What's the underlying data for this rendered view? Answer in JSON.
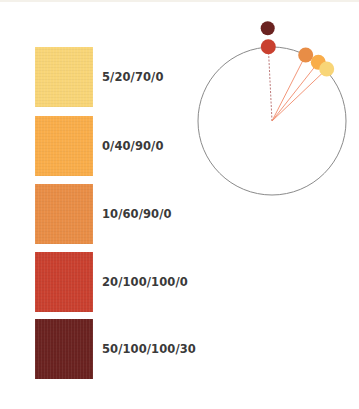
{
  "swatches": [
    {
      "label": "5/20/70/0",
      "color": "#f8d577"
    },
    {
      "label": "0/40/90/0",
      "color": "#f9ad4a"
    },
    {
      "label": "10/60/90/0",
      "color": "#e88d46"
    },
    {
      "label": "20/100/100/0",
      "color": "#c9402f"
    },
    {
      "label": "50/100/100/30",
      "color": "#6a2220"
    }
  ],
  "wheel": {
    "center": [
      272,
      121
    ],
    "radius": 74,
    "stroke_color": "#8a8a8a",
    "line_color": "#f08a6a",
    "dots": [
      {
        "name": "dark-red-dot",
        "color": "#6a2220",
        "cx": 267.7,
        "cy": 28.3,
        "r": 7,
        "line": "none"
      },
      {
        "name": "red-dot",
        "color": "#c9402f",
        "cx": 268.3,
        "cy": 46.7,
        "r": 7.5,
        "line": "dashed"
      },
      {
        "name": "orange-brown-dot",
        "color": "#e88d46",
        "cx": 305.7,
        "cy": 55,
        "r": 7.5,
        "line": "solid"
      },
      {
        "name": "orange-dot",
        "color": "#f9ad4a",
        "cx": 318.3,
        "cy": 62.3,
        "r": 7.5,
        "line": "solid"
      },
      {
        "name": "yellow-dot",
        "color": "#f8d577",
        "cx": 326.7,
        "cy": 69,
        "r": 7.5,
        "line": "solid"
      }
    ]
  }
}
